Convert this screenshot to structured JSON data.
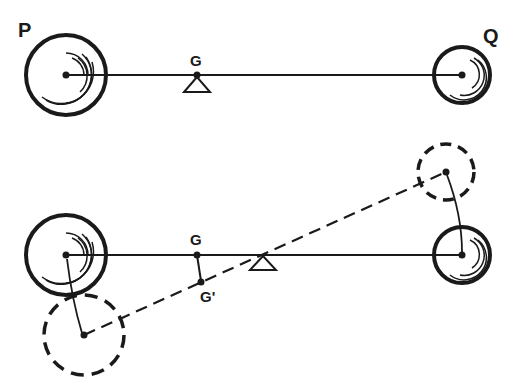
{
  "labels": {
    "P": "P",
    "Q": "Q",
    "G_top": "G",
    "G_bottom": "G",
    "G_prime": "G'"
  },
  "colors": {
    "ink": "#1a1a1a",
    "background": "#ffffff"
  },
  "top_figure": {
    "description": "Balance beam with masses P (large) and Q (small), pivot under center of gravity G",
    "beam": {
      "x1": 66,
      "y1": 75,
      "x2": 462,
      "y2": 75
    },
    "P": {
      "cx": 66,
      "cy": 75,
      "r": 40
    },
    "Q": {
      "cx": 462,
      "cy": 75,
      "r": 28
    },
    "G": {
      "x": 197,
      "y": 75
    },
    "pivot": {
      "x": 197,
      "y": 75
    }
  },
  "bottom_figure": {
    "description": "Beam balanced at pivot; masses displaced to dashed positions, center of gravity shifts from G to G'",
    "beam": {
      "x1": 66,
      "y1": 255,
      "x2": 462,
      "y2": 255
    },
    "P": {
      "cx": 66,
      "cy": 255,
      "r": 40
    },
    "Q": {
      "cx": 462,
      "cy": 255,
      "r": 28
    },
    "P_displaced": {
      "cx": 84,
      "cy": 335,
      "r": 40
    },
    "Q_displaced": {
      "cx": 446,
      "cy": 172,
      "r": 28
    },
    "G": {
      "x": 197,
      "y": 255
    },
    "G_prime": {
      "x": 201,
      "y": 282
    },
    "pivot": {
      "x": 263,
      "y": 255
    }
  }
}
